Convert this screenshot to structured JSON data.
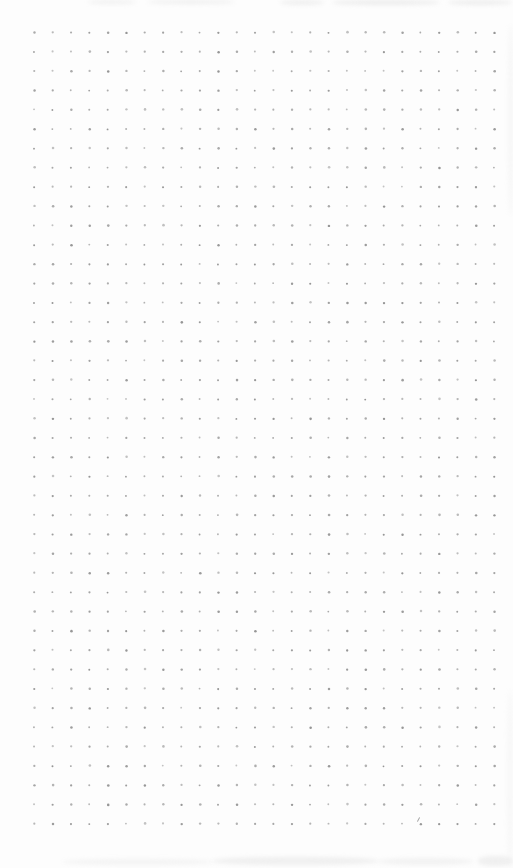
{
  "page": {
    "width": 513,
    "height": 868,
    "background_color": "#fdfdfd"
  },
  "grid": {
    "rows": 42,
    "columns": 26,
    "origin_x": 34.3,
    "origin_y": 32.5,
    "spacing_x": 18.4,
    "spacing_y": 19.3,
    "dot_radius": 1.05,
    "dot_color": "#8c8c8c"
  },
  "artifacts": {
    "smudge_color": "#e2e2e2",
    "smudges": [
      {
        "name": "scan-smudge-top",
        "x": 88,
        "y": 0,
        "w": 48,
        "h": 4,
        "opacity": 0.45
      },
      {
        "name": "scan-smudge-top",
        "x": 148,
        "y": 0,
        "w": 86,
        "h": 4,
        "opacity": 0.5
      },
      {
        "name": "scan-smudge-top",
        "x": 280,
        "y": 0,
        "w": 44,
        "h": 5,
        "opacity": 0.5
      },
      {
        "name": "scan-smudge-top",
        "x": 332,
        "y": 0,
        "w": 108,
        "h": 5,
        "opacity": 0.6
      },
      {
        "name": "scan-smudge-top",
        "x": 448,
        "y": 0,
        "w": 64,
        "h": 5,
        "opacity": 0.55
      },
      {
        "name": "scan-smudge-bottom",
        "x": 63,
        "y": 859,
        "w": 150,
        "h": 6,
        "opacity": 0.35
      },
      {
        "name": "scan-smudge-bottom",
        "x": 213,
        "y": 857,
        "w": 165,
        "h": 8,
        "opacity": 0.5
      },
      {
        "name": "scan-smudge-bottom",
        "x": 378,
        "y": 858,
        "w": 95,
        "h": 7,
        "opacity": 0.4
      },
      {
        "name": "scan-smudge-bottom",
        "x": 478,
        "y": 856,
        "w": 35,
        "h": 10,
        "opacity": 0.5
      },
      {
        "name": "scan-smudge-right",
        "x": 508,
        "y": 25,
        "w": 5,
        "h": 190,
        "opacity": 0.25
      },
      {
        "name": "scan-smudge-right",
        "x": 507,
        "y": 690,
        "w": 6,
        "h": 178,
        "opacity": 0.2
      }
    ],
    "speck": {
      "x": 417.5,
      "y": 817,
      "length": 5,
      "angle_deg": 28,
      "color": "#8a8a8a"
    }
  }
}
